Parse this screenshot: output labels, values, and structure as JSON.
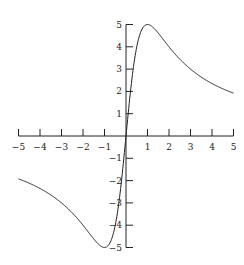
{
  "chart_data": {
    "type": "line",
    "title": "",
    "xlabel": "",
    "ylabel": "",
    "function": "f(x) = 10x / (1 + x^2)",
    "xlim": [
      -5,
      5
    ],
    "ylim": [
      -5,
      5
    ],
    "grid": false,
    "legend": null,
    "axes_style": "centered at origin",
    "x_ticks": [
      -5,
      -4,
      -3,
      -2,
      -1,
      1,
      2,
      3,
      4,
      5
    ],
    "x_tick_labels": [
      "−5",
      "−4",
      "−3",
      "−2",
      "−1",
      "1",
      "2",
      "3",
      "4",
      "5"
    ],
    "y_ticks": [
      -5,
      -4,
      -3,
      -2,
      -1,
      1,
      2,
      3,
      4,
      5
    ],
    "y_tick_labels": [
      "−5",
      "−4",
      "−3",
      "−2",
      "−1",
      "1",
      "2",
      "3",
      "4",
      "5"
    ],
    "series": [
      {
        "name": "f(x)",
        "x": [
          -5,
          -4,
          -3,
          -2,
          -1.5,
          -1,
          -0.5,
          0,
          0.5,
          1,
          1.5,
          2,
          3,
          4,
          5
        ],
        "y": [
          -1.92,
          -2.35,
          -3.0,
          -4.0,
          -4.62,
          -5.0,
          -4.0,
          0,
          4.0,
          5.0,
          4.62,
          4.0,
          3.0,
          2.35,
          1.92
        ]
      }
    ],
    "color": "#222222"
  }
}
